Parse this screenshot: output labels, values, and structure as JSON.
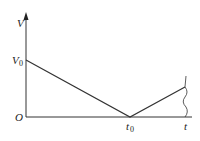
{
  "diagram": {
    "y_axis_label": "V",
    "x_axis_label": "t",
    "origin_label": "O",
    "v0_label": "V",
    "v0_sub": "0",
    "t0_label": "t",
    "t0_sub": "0",
    "line_color": "#333333"
  }
}
